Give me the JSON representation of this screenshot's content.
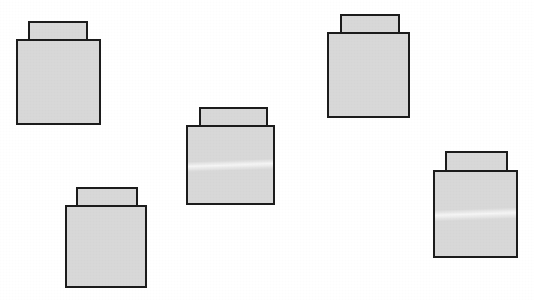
{
  "scene": {
    "title": "Scattered Block Shapes",
    "width": 534,
    "height": 300,
    "background_color": "#ffffff",
    "shape_count": 5,
    "shape_description": "small rectangle (knob) centered on top of a larger square (body)",
    "fill_color": "#d8d8d8",
    "outline_color": "#1c1c1c",
    "outline_width_px": 2
  },
  "shapes": [
    {
      "id": "block-1",
      "label": "top-left block",
      "knob": {
        "x": 28,
        "y": 21,
        "w": 60,
        "h": 20
      },
      "body": {
        "x": 16,
        "y": 39,
        "w": 85,
        "h": 86
      },
      "has_streak": false
    },
    {
      "id": "block-2",
      "label": "bottom-left block",
      "knob": {
        "x": 76,
        "y": 187,
        "w": 62,
        "h": 20
      },
      "body": {
        "x": 65,
        "y": 205,
        "w": 82,
        "h": 83
      },
      "has_streak": false
    },
    {
      "id": "block-3",
      "label": "center block",
      "knob": {
        "x": 199,
        "y": 107,
        "w": 69,
        "h": 20
      },
      "body": {
        "x": 186,
        "y": 125,
        "w": 89,
        "h": 80
      },
      "has_streak": true
    },
    {
      "id": "block-4",
      "label": "top-right block",
      "knob": {
        "x": 340,
        "y": 14,
        "w": 60,
        "h": 20
      },
      "body": {
        "x": 327,
        "y": 32,
        "w": 83,
        "h": 86
      },
      "has_streak": false
    },
    {
      "id": "block-5",
      "label": "bottom-right block",
      "knob": {
        "x": 445,
        "y": 151,
        "w": 63,
        "h": 21
      },
      "body": {
        "x": 433,
        "y": 170,
        "w": 85,
        "h": 88
      },
      "has_streak": true
    }
  ]
}
